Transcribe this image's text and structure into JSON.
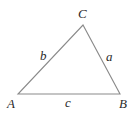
{
  "diagram": {
    "type": "triangle",
    "stroke_color": "#8a8a8a",
    "label_color": "#2a2a2a",
    "vertices": {
      "A": {
        "label": "A",
        "x": 18,
        "y": 94
      },
      "B": {
        "label": "B",
        "x": 120,
        "y": 94
      },
      "C": {
        "label": "C",
        "x": 83,
        "y": 25
      }
    },
    "sides": {
      "a": {
        "label": "a",
        "between": [
          "B",
          "C"
        ]
      },
      "b": {
        "label": "b",
        "between": [
          "A",
          "C"
        ]
      },
      "c": {
        "label": "c",
        "between": [
          "A",
          "B"
        ]
      }
    }
  }
}
